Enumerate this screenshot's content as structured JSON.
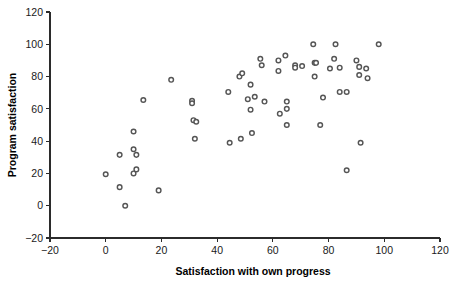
{
  "chart_data": {
    "type": "scatter",
    "title": "",
    "xlabel": "Satisfaction with own progress",
    "ylabel": "Program satisfaction",
    "xlim": [
      -20,
      120
    ],
    "ylim": [
      -20,
      120
    ],
    "xticks": [
      -20,
      0,
      20,
      40,
      60,
      80,
      100,
      120
    ],
    "yticks": [
      -20,
      0,
      20,
      40,
      60,
      80,
      100,
      120
    ],
    "xtick_labels": [
      "−20",
      "0",
      "20",
      "40",
      "60",
      "80",
      "100",
      "120"
    ],
    "ytick_labels": [
      "−20",
      "0",
      "20",
      "40",
      "60",
      "80",
      "100",
      "120"
    ],
    "grid": false,
    "legend": null,
    "marker": {
      "shape": "circle",
      "size": 2.3,
      "fill_color": "#ffffff",
      "edge_color": "#555555"
    },
    "axis_color": "#2b2b2b",
    "background_color": "#ffffff",
    "n_points": 73,
    "points": [
      [
        0,
        19.5
      ],
      [
        5,
        31.5
      ],
      [
        5,
        11.5
      ],
      [
        7,
        0
      ],
      [
        10,
        46
      ],
      [
        10,
        35
      ],
      [
        10,
        20
      ],
      [
        11,
        31.5
      ],
      [
        11,
        22.5
      ],
      [
        13.5,
        65.5
      ],
      [
        19,
        9.5
      ],
      [
        23.5,
        78
      ],
      [
        31,
        65
      ],
      [
        31,
        63.5
      ],
      [
        31.5,
        53
      ],
      [
        32.5,
        52
      ],
      [
        32,
        41.5
      ],
      [
        44,
        70.5
      ],
      [
        44.5,
        39
      ],
      [
        48,
        80
      ],
      [
        49,
        82
      ],
      [
        48.5,
        41.5
      ],
      [
        51,
        66
      ],
      [
        52,
        75
      ],
      [
        52,
        59.5
      ],
      [
        52.5,
        45
      ],
      [
        53.5,
        67.5
      ],
      [
        55.5,
        91
      ],
      [
        56,
        87
      ],
      [
        57,
        64.5
      ],
      [
        62,
        90
      ],
      [
        62,
        83.5
      ],
      [
        62.5,
        57
      ],
      [
        64.5,
        93
      ],
      [
        65,
        64.5
      ],
      [
        65,
        60
      ],
      [
        65,
        50
      ],
      [
        68,
        87
      ],
      [
        68,
        85.5
      ],
      [
        70.5,
        86.5
      ],
      [
        74.5,
        100
      ],
      [
        75,
        88.5
      ],
      [
        75.5,
        88.5
      ],
      [
        75,
        80
      ],
      [
        77,
        50
      ],
      [
        78,
        67
      ],
      [
        80.5,
        85
      ],
      [
        82,
        91
      ],
      [
        82.5,
        100
      ],
      [
        84,
        85.5
      ],
      [
        84,
        70.5
      ],
      [
        86.5,
        70.5
      ],
      [
        86.5,
        22
      ],
      [
        90,
        90
      ],
      [
        91,
        86
      ],
      [
        91,
        81
      ],
      [
        91.5,
        39
      ],
      [
        93.5,
        85
      ],
      [
        94,
        79
      ],
      [
        98,
        100
      ]
    ]
  },
  "figure": {
    "width": 456,
    "height": 284
  }
}
